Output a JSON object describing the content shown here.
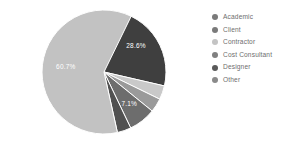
{
  "chart_data": {
    "type": "pie",
    "title": "",
    "legend_position": "right",
    "categories": [
      "Academic",
      "Client",
      "Contractor",
      "Cost Consultant",
      "Designer",
      "Other"
    ],
    "values": [
      28.6,
      3.6,
      60.7,
      7.1,
      3.6,
      3.6
    ],
    "value_unit": "%",
    "labels_shown": [
      "28.6%",
      "7.1%",
      "60.7%"
    ],
    "slices": [
      {
        "name": "Academic",
        "value": 28.6,
        "label": "28.6%",
        "label_visible": true,
        "color": "#3f3f3f",
        "start_angle": 0,
        "end_angle": 103.0
      },
      {
        "name": "Client",
        "value": 3.6,
        "label": "3.6%",
        "label_visible": false,
        "color": "#c9c9c9",
        "start_angle": 103.0,
        "end_angle": 116.0
      },
      {
        "name": "Contractor",
        "value": 3.6,
        "label": "3.6%",
        "label_visible": false,
        "color": "#9a9a9a",
        "start_angle": 116.0,
        "end_angle": 129.0
      },
      {
        "name": "Cost Consultant",
        "value": 7.1,
        "label": "7.1%",
        "label_visible": true,
        "color": "#6d6d6d",
        "start_angle": 129.0,
        "end_angle": 154.5
      },
      {
        "name": "Designer",
        "value": 3.6,
        "label": "3.6%",
        "label_visible": false,
        "color": "#515151",
        "start_angle": 154.5,
        "end_angle": 167.5
      },
      {
        "name": "Other",
        "value": 60.7,
        "label": "60.7%",
        "label_visible": true,
        "color": "#c2c2c2",
        "start_angle": 167.5,
        "end_angle": 386.0
      }
    ]
  },
  "legend": {
    "items": [
      {
        "label": "Academic",
        "color": "#7a7a7a"
      },
      {
        "label": "Client",
        "color": "#7a7a7a"
      },
      {
        "label": "Contractor",
        "color": "#c4c4c4"
      },
      {
        "label": "Cost Consultant",
        "color": "#808080"
      },
      {
        "label": "Designer",
        "color": "#5a5a5a"
      },
      {
        "label": "Other",
        "color": "#8a8a8a"
      }
    ]
  }
}
